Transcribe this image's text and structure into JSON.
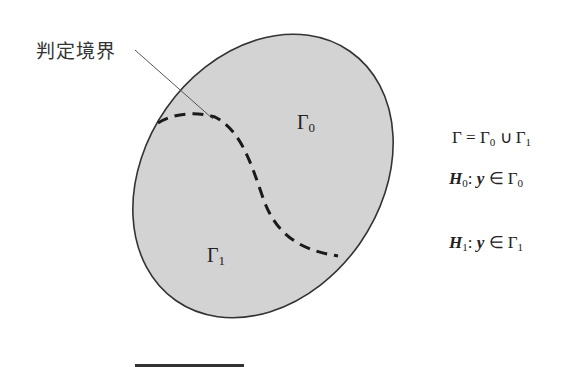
{
  "diagram": {
    "boundary_label": "判定境界",
    "region_upper": {
      "symbol": "Γ",
      "subscript": "0"
    },
    "region_lower": {
      "symbol": "Γ",
      "subscript": "1"
    },
    "equations": [
      {
        "lhs": "Γ",
        "text": " = Γ",
        "sub1": "0",
        "mid": " ∪ Γ",
        "sub2": "1"
      },
      {
        "lhs": "H",
        "lhs_sub": "0",
        "colon": ": ",
        "var": "y",
        "rel": " ∈ Γ",
        "rhs_sub": "0"
      },
      {
        "lhs": "H",
        "lhs_sub": "1",
        "colon": ": ",
        "var": "y",
        "rel": " ∈ Γ",
        "rhs_sub": "1"
      }
    ],
    "colors": {
      "fill": "#d3d3d3",
      "outline": "#333333",
      "dash": "#1a1a1a",
      "leader": "#555555"
    }
  }
}
